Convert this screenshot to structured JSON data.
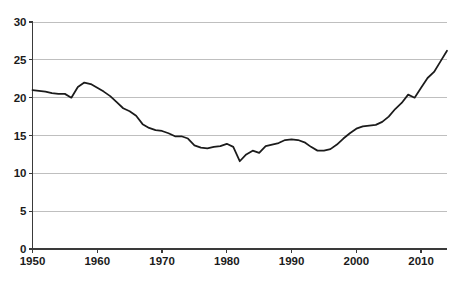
{
  "chart_data": {
    "type": "line",
    "title": "",
    "subtitle": "",
    "xlabel": "",
    "ylabel": "",
    "xlim": [
      1950,
      2014
    ],
    "ylim": [
      0,
      30
    ],
    "grid": true,
    "legend": "none",
    "y_ticks": [
      0,
      5,
      10,
      15,
      20,
      25,
      30
    ],
    "y_tick_labels": [
      "0",
      "5",
      "10",
      "15",
      "20",
      "25",
      "30"
    ],
    "x_ticks": [
      1950,
      1960,
      1970,
      1980,
      1990,
      2000,
      2010
    ],
    "x_tick_labels": [
      "1950",
      "1960",
      "1970",
      "1980",
      "1990",
      "2000",
      "2010"
    ],
    "line_color": "#1b1b1b",
    "grid_color": "#b8b8b8",
    "axis_color": "#3a3a3a",
    "series": [
      {
        "name": "series-1",
        "x": [
          1950,
          1951,
          1952,
          1953,
          1954,
          1955,
          1956,
          1957,
          1958,
          1959,
          1960,
          1961,
          1962,
          1963,
          1964,
          1965,
          1966,
          1967,
          1968,
          1969,
          1970,
          1971,
          1972,
          1973,
          1974,
          1975,
          1976,
          1977,
          1978,
          1979,
          1980,
          1981,
          1982,
          1983,
          1984,
          1985,
          1986,
          1987,
          1988,
          1989,
          1990,
          1991,
          1992,
          1993,
          1994,
          1995,
          1996,
          1997,
          1998,
          1999,
          2000,
          2001,
          2002,
          2003,
          2004,
          2005,
          2006,
          2007,
          2008,
          2009,
          2010,
          2011,
          2012,
          2013,
          2014
        ],
        "y": [
          21.0,
          20.9,
          20.8,
          20.6,
          20.5,
          20.5,
          20.0,
          21.4,
          22.0,
          21.8,
          21.3,
          20.8,
          20.2,
          19.4,
          18.6,
          18.2,
          17.6,
          16.5,
          16.0,
          15.7,
          15.6,
          15.3,
          14.9,
          14.9,
          14.6,
          13.7,
          13.4,
          13.3,
          13.5,
          13.6,
          13.9,
          13.5,
          11.6,
          12.5,
          13.0,
          12.7,
          13.6,
          13.8,
          14.0,
          14.4,
          14.5,
          14.4,
          14.1,
          13.5,
          13.0,
          13.0,
          13.2,
          13.8,
          14.6,
          15.3,
          15.9,
          16.2,
          16.3,
          16.4,
          16.8,
          17.5,
          18.5,
          19.3,
          20.4,
          20.0,
          21.3,
          22.6,
          23.4,
          24.8,
          26.2
        ]
      }
    ]
  }
}
